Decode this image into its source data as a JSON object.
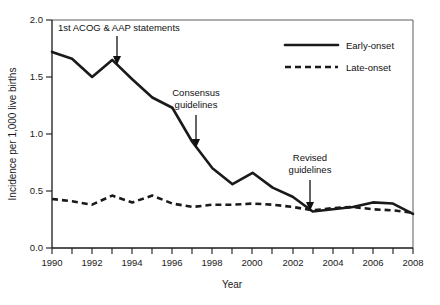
{
  "chart_data": {
    "type": "line",
    "title": "",
    "xlabel": "Year",
    "ylabel": "Incidence per 1,000 live births",
    "xlim": [
      1990,
      2008
    ],
    "ylim": [
      0.0,
      2.0
    ],
    "grid": false,
    "legend_position": "top-right",
    "x": [
      1990,
      1991,
      1992,
      1993,
      1994,
      1995,
      1996,
      1997,
      1998,
      1999,
      2000,
      2001,
      2002,
      2003,
      2004,
      2005,
      2006,
      2007,
      2008
    ],
    "xtick_labels": [
      "1990",
      "1992",
      "1994",
      "1996",
      "1998",
      "2000",
      "2002",
      "2004",
      "2006",
      "2008"
    ],
    "xtick_values": [
      1990,
      1992,
      1994,
      1996,
      1998,
      2000,
      2002,
      2004,
      2006,
      2008
    ],
    "ytick_labels": [
      "0.0",
      "0.5",
      "1.0",
      "1.5",
      "2.0"
    ],
    "ytick_values": [
      0.0,
      0.5,
      1.0,
      1.5,
      2.0
    ],
    "series": [
      {
        "name": "Early-onset",
        "style": "solid",
        "color": "#1a1a1a",
        "values": [
          1.72,
          1.66,
          1.5,
          1.65,
          1.48,
          1.32,
          1.23,
          0.93,
          0.7,
          0.56,
          0.66,
          0.53,
          0.45,
          0.32,
          0.34,
          0.36,
          0.4,
          0.39,
          0.3
        ]
      },
      {
        "name": "Late-onset",
        "style": "dashed",
        "color": "#1a1a1a",
        "values": [
          0.43,
          0.41,
          0.38,
          0.46,
          0.4,
          0.46,
          0.39,
          0.36,
          0.38,
          0.38,
          0.39,
          0.38,
          0.36,
          0.33,
          0.35,
          0.36,
          0.34,
          0.33,
          0.31
        ]
      }
    ],
    "annotations": [
      {
        "id": "acog",
        "text": "1st ACOG & AAP statements",
        "target_year": 1993,
        "target_value": 1.65
      },
      {
        "id": "consensus",
        "text_line1": "Consensus",
        "text_line2": "guidelines",
        "target_year": 1996,
        "target_value": 1.23
      },
      {
        "id": "revised",
        "text_line1": "Revised",
        "text_line2": "guidelines",
        "target_year": 2003,
        "target_value": 0.32
      }
    ]
  },
  "legend": {
    "items": [
      {
        "label": "Early-onset",
        "style": "solid"
      },
      {
        "label": "Late-onset",
        "style": "dashed"
      }
    ]
  }
}
